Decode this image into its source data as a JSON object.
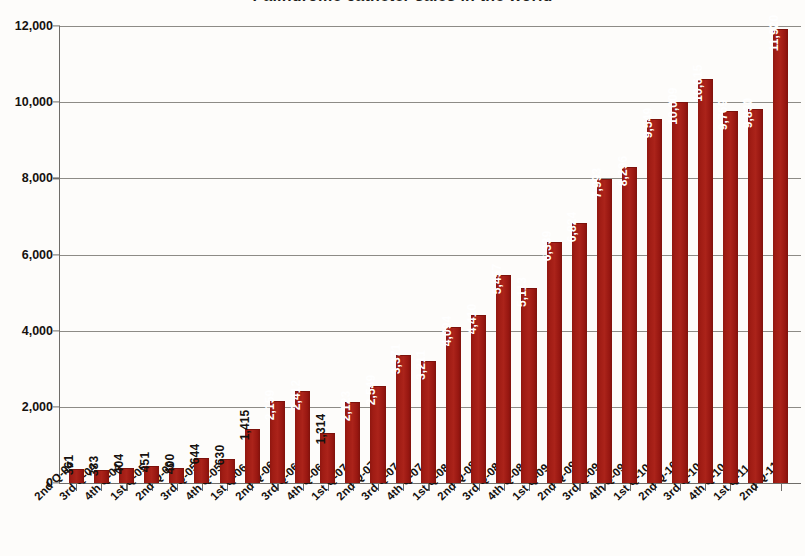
{
  "chart_data": {
    "type": "bar",
    "title": "Palindrome catheter sales in the world",
    "xlabel": "",
    "ylabel": "",
    "ylim": [
      0,
      12000
    ],
    "yticks": [
      "0",
      "2,000",
      "4,000",
      "6,000",
      "8,000",
      "10,000",
      "12,000"
    ],
    "ytick_values": [
      0,
      2000,
      4000,
      6000,
      8000,
      10000,
      12000
    ],
    "grid": true,
    "legend": "none",
    "bar_color": "#9e1b14",
    "categories": [
      "2nd Q-04",
      "3rd Q-04",
      "4th Q-04",
      "1st Q-05",
      "2nd Q-05",
      "3rd Q-05",
      "4th Q-05",
      "1st Q-06",
      "2nd Q-06",
      "3rd Q-06",
      "4th Q-06",
      "1st Q-07",
      "2nd Q-07",
      "3rd Q-07",
      "4th Q-07",
      "1st Q-08",
      "2nd Q-08",
      "3rd Q-08",
      "4th Q-08",
      "1st Q-09",
      "2nd Q-09",
      "3rd Q-09",
      "4th Q-09",
      "1st Q-10",
      "2nd Q-10",
      "3rd Q-10",
      "4th Q-10",
      "1st Q-11",
      "2nd Q-11"
    ],
    "values": [
      361,
      333,
      404,
      451,
      400,
      644,
      630,
      1415,
      2159,
      2412,
      1314,
      2123,
      2549,
      3371,
      3211,
      4094,
      4410,
      5457,
      5113,
      6339,
      6824,
      7993,
      8296,
      9549,
      10009,
      10615,
      9769,
      9830,
      11920
    ],
    "value_labels": [
      "361",
      "333",
      "404",
      "451",
      "400",
      "644",
      "630",
      "1,415",
      "2,159",
      "2,412",
      "1,314",
      "2,123",
      "2,549",
      "3,371",
      "3,211",
      "4,094",
      "4,410",
      "5,457",
      "5,113",
      "6,339",
      "6,824",
      "7,993",
      "8,296",
      "9,549",
      "10,009",
      "10,615",
      "9,769",
      "9,830",
      "11,920"
    ]
  }
}
